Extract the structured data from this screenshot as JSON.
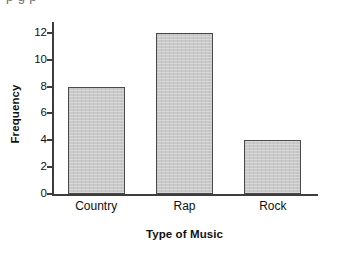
{
  "clipped_top_text": "p      g  p",
  "chart_data": {
    "type": "bar",
    "title": "",
    "categories": [
      "Country",
      "Rap",
      "Rock"
    ],
    "values": [
      8,
      12,
      4
    ],
    "xlabel": "Type of Music",
    "ylabel": "Frequency",
    "ylim": [
      0,
      12.8
    ],
    "yticks": [
      0,
      2,
      4,
      6,
      8,
      10,
      12
    ],
    "ytick_labels": [
      "0",
      "2",
      "4",
      "6",
      "8",
      "10",
      "12"
    ],
    "grid": false,
    "legend": false,
    "series": [
      {
        "name": "Frequency",
        "values": [
          8,
          12,
          4
        ]
      }
    ],
    "bar_fill_color": "#c9c9c9",
    "bar_edge_color": "#4a4a4a",
    "axis_color": "#3d3d3d",
    "background_color": "#ffffff",
    "text_color": "#111111"
  }
}
